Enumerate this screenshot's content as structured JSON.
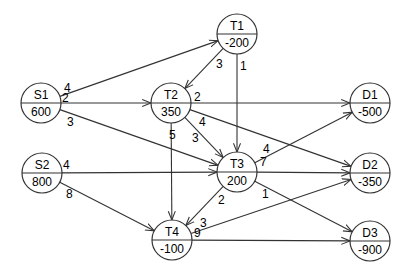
{
  "diagram": {
    "type": "transshipment-network",
    "colors": {
      "line": "#333333",
      "node_fill": "#ffffff",
      "node_stroke": "#333333",
      "text": "#000000"
    },
    "nodes": [
      {
        "id": "S1",
        "name": "S1",
        "value": "600",
        "x": 41,
        "y": 103
      },
      {
        "id": "S2",
        "name": "S2",
        "value": "800",
        "x": 42,
        "y": 173
      },
      {
        "id": "T1",
        "name": "T1",
        "value": "-200",
        "x": 237,
        "y": 34
      },
      {
        "id": "T2",
        "name": "T2",
        "value": "350",
        "x": 171,
        "y": 103
      },
      {
        "id": "T3",
        "name": "T3",
        "value": "200",
        "x": 237,
        "y": 172
      },
      {
        "id": "T4",
        "name": "T4",
        "value": "-100",
        "x": 172,
        "y": 240
      },
      {
        "id": "D1",
        "name": "D1",
        "value": "-500",
        "x": 370,
        "y": 103
      },
      {
        "id": "D2",
        "name": "D2",
        "value": "-350",
        "x": 370,
        "y": 173
      },
      {
        "id": "D3",
        "name": "D3",
        "value": "-900",
        "x": 370,
        "y": 241
      }
    ],
    "edges": [
      {
        "from": "S1",
        "to": "T1",
        "cost": "4",
        "lx": 64,
        "ly": 92
      },
      {
        "from": "S1",
        "to": "T2",
        "cost": "2",
        "lx": 62,
        "ly": 102
      },
      {
        "from": "S1",
        "to": "T3",
        "cost": "3",
        "lx": 67,
        "ly": 126
      },
      {
        "from": "T1",
        "to": "T2",
        "cost": "3",
        "lx": 216,
        "ly": 68
      },
      {
        "from": "T1",
        "to": "T3",
        "cost": "1",
        "lx": 240,
        "ly": 70
      },
      {
        "from": "T2",
        "to": "D1",
        "cost": "2",
        "lx": 194,
        "ly": 101
      },
      {
        "from": "T2",
        "to": "D2",
        "cost": "4",
        "lx": 199,
        "ly": 126
      },
      {
        "from": "T2",
        "to": "T3",
        "cost": "3",
        "lx": 192,
        "ly": 142
      },
      {
        "from": "T2",
        "to": "T4",
        "cost": "5",
        "lx": 169,
        "ly": 139
      },
      {
        "from": "S2",
        "to": "T3",
        "cost": "4",
        "lx": 63,
        "ly": 169
      },
      {
        "from": "S2",
        "to": "T4",
        "cost": "8",
        "lx": 66,
        "ly": 198
      },
      {
        "from": "T3",
        "to": "D1",
        "cost": "4",
        "lx": 263,
        "ly": 153
      },
      {
        "from": "T3",
        "to": "D2",
        "cost": "7",
        "lx": 260,
        "ly": 166
      },
      {
        "from": "T3",
        "to": "D3",
        "cost": "1",
        "lx": 262,
        "ly": 198
      },
      {
        "from": "T3",
        "to": "T4",
        "cost": "2",
        "lx": 218,
        "ly": 204
      },
      {
        "from": "T4",
        "to": "D2",
        "cost": "3",
        "lx": 200,
        "ly": 227
      },
      {
        "from": "T4",
        "to": "D3",
        "cost": "9",
        "lx": 194,
        "ly": 237
      }
    ],
    "node_radius": 20
  }
}
